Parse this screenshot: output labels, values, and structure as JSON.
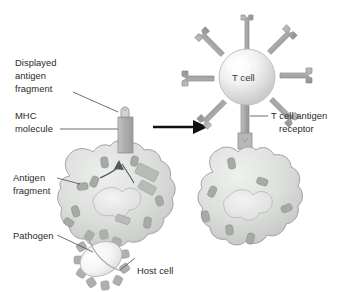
{
  "figure": {
    "type": "biological-process-diagram"
  },
  "colors": {
    "cell_fill_light": "#e2e4e2",
    "cell_fill_mid": "#cfd1cf",
    "cell_outline": "#9a9a9a",
    "fragment_gray": "#a8aaa8",
    "organelle_gray": "#b9bbb9",
    "receptor_gray": "#a9aba9",
    "arrow_black": "#111111",
    "label_text": "#2a2a2a",
    "background": "#ffffff"
  },
  "labels": {
    "displayed_antigen_fragment": "Displayed\nantigen\nfragment",
    "displayed_antigen_fragment_lines": [
      "Displayed",
      "antigen",
      "fragment"
    ],
    "mhc_molecule_lines": [
      "MHC",
      "molecule"
    ],
    "antigen_fragment_lines": [
      "Antigen",
      "fragment"
    ],
    "pathogen": "Pathogen",
    "host_cell": "Host cell",
    "t_cell": "T cell",
    "t_cell_antigen_receptor_lines": [
      "T cell antigen",
      "receptor"
    ]
  },
  "structures": {
    "left_panel": {
      "name": "antigen-presenting-host-cell",
      "parts": [
        "host-cell-body",
        "nucleus",
        "mhc-molecule",
        "displayed-antigen-fragment",
        "antigen-fragments",
        "internal-vesicles",
        "pathogen",
        "processing-arrow"
      ],
      "antigen_fragment_count": 8
    },
    "right_panel": {
      "name": "t-cell-bound-host-cell",
      "parts": [
        "t-cell-sphere",
        "t-cell-antigen-receptors",
        "engaged-receptor-stalk",
        "host-cell-body",
        "nucleus",
        "antigen-fragments"
      ],
      "receptor_arm_count": 8,
      "antigen_fragment_count": 7
    },
    "transition_arrow": {
      "name": "process-arrow",
      "direction": "right"
    }
  }
}
